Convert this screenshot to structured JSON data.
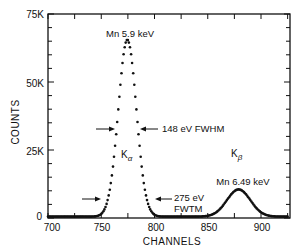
{
  "chart_data": {
    "type": "scatter",
    "title": "",
    "xlabel": "CHANNELS",
    "ylabel": "COUNTS",
    "xlim": [
      700,
      925
    ],
    "ylim": [
      0,
      75000
    ],
    "x_ticks": [
      700,
      750,
      800,
      850,
      900
    ],
    "x_tick_labels": [
      "700",
      "750",
      "800",
      "850",
      "900"
    ],
    "y_ticks": [
      0,
      25000,
      50000,
      75000
    ],
    "y_tick_labels": [
      "0",
      "25K",
      "50K",
      "75K"
    ],
    "grid": false,
    "legend": null,
    "peaks": [
      {
        "name": "K_alpha",
        "label": "Mn 5.9 keV",
        "center_channel": 774.5,
        "height": 65000,
        "sigma_channels": 8.5
      },
      {
        "name": "K_beta",
        "label": "Mn 6.49 keV",
        "center_channel": 879,
        "height": 10000,
        "sigma_channels": 11
      }
    ],
    "series": [
      {
        "name": "Mn X-ray spectrum",
        "x": [
          700,
          705,
          710,
          715,
          720,
          725,
          730,
          735,
          740,
          745,
          750,
          752,
          754,
          756,
          758,
          760,
          762,
          764,
          766,
          768,
          770,
          772,
          774,
          776,
          778,
          780,
          782,
          784,
          786,
          788,
          790,
          792,
          794,
          796,
          798,
          800,
          805,
          810,
          815,
          820,
          825,
          830,
          835,
          840,
          845,
          850,
          855,
          860,
          865,
          870,
          875,
          880,
          885,
          890,
          895,
          900,
          905,
          910,
          915,
          920,
          925
        ],
        "values": [
          500,
          500,
          500,
          500,
          500,
          500,
          500,
          600,
          900,
          2000,
          6000,
          9000,
          14000,
          20000,
          27000,
          35000,
          43000,
          51000,
          57500,
          62000,
          64500,
          65000,
          64500,
          62000,
          57500,
          51000,
          43000,
          35000,
          27000,
          20000,
          14000,
          9000,
          6000,
          3600,
          2200,
          1300,
          600,
          500,
          500,
          500,
          500,
          500,
          700,
          1200,
          2200,
          3800,
          5600,
          7500,
          9000,
          9800,
          10000,
          9800,
          9000,
          7500,
          5500,
          3200,
          1500,
          800,
          600,
          500,
          500
        ]
      }
    ],
    "annotations": [
      {
        "text": "Mn 5.9 keV",
        "position": "above K_alpha peak"
      },
      {
        "text": "148 eV FWHM",
        "position": "arrows at half maximum of K_alpha"
      },
      {
        "text": "275 eV FWTM",
        "position": "arrows at tenth maximum of K_alpha"
      },
      {
        "text": "K_alpha",
        "position": "inside K_alpha peak"
      },
      {
        "text": "K_beta",
        "position": "above K_beta peak"
      },
      {
        "text": "Mn 6.49 keV",
        "position": "above K_beta peak"
      }
    ]
  },
  "labels": {
    "xlabel": "CHANNELS",
    "ylabel": "COUNTS",
    "y75": "75K",
    "y50": "50K",
    "y25": "25K",
    "y0": "0",
    "x700": "700",
    "x750": "750",
    "x800": "800",
    "x850": "850",
    "x900": "900",
    "ka_peak": "Mn 5.9 keV",
    "fwhm": "148 eV FWHM",
    "fwtm_1": "275 eV",
    "fwtm_2": "FWTM",
    "ka": "K",
    "ka_sub": "α",
    "kb": "K",
    "kb_sub": "β",
    "kb_peak": "Mn 6.49 keV"
  }
}
